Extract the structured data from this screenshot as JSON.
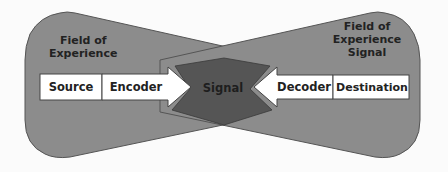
{
  "colors": {
    "background": "#fbfbfb",
    "field_fill": "#8c8c8c",
    "field_stroke": "#555555",
    "signal_fill": "#555555",
    "box_fill": "#ffffff",
    "box_stroke": "#444444",
    "text": "#222222"
  },
  "left_field": {
    "label_line1": "Field of",
    "label_line2": "Experience"
  },
  "right_field": {
    "label_line1": "Field of",
    "label_line2": "Experience",
    "label_line3": "Signal"
  },
  "flow": {
    "source": "Source",
    "encoder": "Encoder",
    "signal": "Signal",
    "decoder": "Decoder",
    "destination": "Destination"
  }
}
